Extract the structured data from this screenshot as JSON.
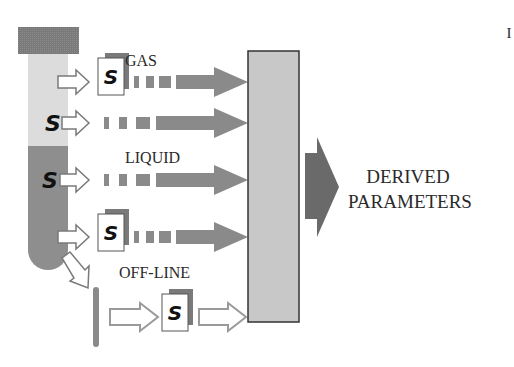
{
  "diagram": {
    "labels": {
      "gas": "GAS",
      "liquid": "LIQUID",
      "offline": "OFF-LINE",
      "output_line1": "DERIVED",
      "output_line2": "PARAMETERS",
      "corner_mark": "I"
    },
    "sensor_symbol": "S",
    "colors": {
      "cap": "#7a7a7a",
      "gas_phase": "#dcdcdc",
      "liquid_phase": "#8e8e8e",
      "flow_arrow": "#8a8a8a",
      "processor_box": "#c8c8c8",
      "output_arrow": "#6a6a6a",
      "outline": "#333333"
    },
    "rows": [
      {
        "id": "gas-sensor",
        "label_key": "gas",
        "sensor_type": "external-sensor"
      },
      {
        "id": "headspace-sensor",
        "sensor_type": "in-situ-sensor"
      },
      {
        "id": "liquid-sensor",
        "label_key": "liquid",
        "sensor_type": "in-situ-sensor"
      },
      {
        "id": "liquid-external-sensor",
        "sensor_type": "external-sensor"
      },
      {
        "id": "offline-sensor",
        "label_key": "offline",
        "sensor_type": "sampled-sensor"
      }
    ]
  }
}
